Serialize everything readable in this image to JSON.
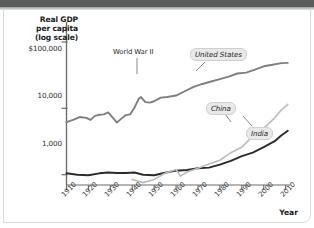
{
  "figure": {
    "background_color": "#ffffff",
    "top_band_color": "#595b5c"
  },
  "axis": {
    "y_title_line1": "Real GDP",
    "y_title_line2": "per capita",
    "y_title_line3": "(log scale)",
    "y_ticks": [
      "$100,000",
      "10,000",
      "1,000"
    ],
    "x_title": "Year",
    "x_ticks": [
      "1910",
      "1920",
      "1930",
      "1940",
      "1950",
      "1960",
      "1970",
      "1980",
      "1990",
      "2000",
      "2010"
    ]
  },
  "annotations": {
    "world_war_2": "World War II",
    "united_states": "United States",
    "china": "China",
    "india": "India"
  },
  "chart_data": {
    "type": "line",
    "title": "",
    "xlabel": "Year",
    "ylabel": "Real GDP per capita (log scale)",
    "y_scale": "log",
    "ylim": [
      700,
      200000
    ],
    "xlim": [
      1910,
      2012
    ],
    "y_tick_values": [
      1000,
      10000,
      100000
    ],
    "y_tick_labels": [
      "1,000",
      "10,000",
      "$100,000"
    ],
    "x_tick_values": [
      1910,
      1920,
      1930,
      1940,
      1950,
      1960,
      1970,
      1980,
      1990,
      2000,
      2010
    ],
    "grid": false,
    "legend_position": "inline-labels",
    "annotations": [
      {
        "text": "World War II",
        "x": 1944,
        "y": 19000
      },
      {
        "text": "United States",
        "x": 1972,
        "y": 36000
      },
      {
        "text": "China",
        "x": 1988,
        "y": 3400
      },
      {
        "text": "India",
        "x": 2002,
        "y": 1900
      }
    ],
    "series": [
      {
        "name": "United States",
        "color": "#7f7f7f",
        "x": [
          1910,
          1913,
          1916,
          1919,
          1921,
          1923,
          1925,
          1927,
          1929,
          1931,
          1933,
          1935,
          1937,
          1939,
          1941,
          1943,
          1944,
          1946,
          1948,
          1950,
          1953,
          1956,
          1960,
          1964,
          1968,
          1972,
          1976,
          1980,
          1984,
          1988,
          1992,
          1996,
          2000,
          2004,
          2008,
          2011
        ],
        "y": [
          6200,
          6700,
          7400,
          7200,
          6700,
          7700,
          8000,
          8100,
          8700,
          7300,
          6100,
          7000,
          7900,
          8100,
          10200,
          14000,
          14800,
          12400,
          12200,
          12800,
          14500,
          14800,
          15600,
          18100,
          21000,
          23300,
          25400,
          27600,
          30000,
          33500,
          34600,
          38200,
          43000,
          45300,
          48000,
          48400
        ]
      },
      {
        "name": "India",
        "color": "#2b2b2b",
        "x": [
          1910,
          1915,
          1920,
          1925,
          1929,
          1933,
          1937,
          1941,
          1945,
          1950,
          1955,
          1960,
          1965,
          1970,
          1975,
          1980,
          1985,
          1990,
          1995,
          2000,
          2005,
          2008,
          2011
        ],
        "y": [
          1050,
          1000,
          980,
          1050,
          1080,
          1060,
          1060,
          1080,
          1000,
          980,
          1070,
          1150,
          1180,
          1250,
          1280,
          1420,
          1620,
          1900,
          2150,
          2600,
          3200,
          3900,
          4600
        ]
      },
      {
        "name": "China",
        "color": "#bcbcbc",
        "x": [
          1940,
          1945,
          1950,
          1955,
          1960,
          1962,
          1965,
          1970,
          1975,
          1980,
          1985,
          1990,
          1995,
          2000,
          2005,
          2008,
          2011
        ],
        "y": [
          850,
          760,
          850,
          1050,
          1200,
          950,
          1100,
          1250,
          1450,
          1650,
          2150,
          2600,
          3800,
          5000,
          7200,
          9400,
          11500
        ]
      }
    ]
  }
}
